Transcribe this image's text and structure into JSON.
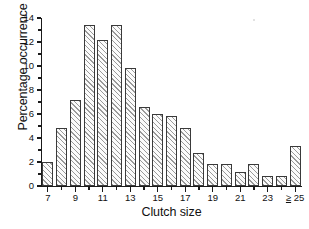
{
  "chart_data": {
    "type": "bar",
    "title": "",
    "subtitle": "",
    "xlabel": "Clutch size",
    "ylabel": "Percentage occurrence",
    "categories": [
      "7",
      "8",
      "9",
      "10",
      "11",
      "12",
      "13",
      "14",
      "15",
      "16",
      "17",
      "18",
      "19",
      "20",
      "21",
      "22",
      "23",
      "24",
      "≥ 25"
    ],
    "values": [
      2.0,
      4.8,
      7.2,
      13.4,
      12.2,
      13.4,
      9.8,
      6.6,
      6.0,
      5.8,
      4.8,
      2.75,
      1.8,
      1.8,
      1.2,
      1.8,
      0.8,
      0.8,
      3.35
    ],
    "ylim": [
      0,
      14
    ],
    "xlim": [
      6.5,
      25.5
    ],
    "y_ticks_major": [
      0,
      2,
      4,
      6,
      8,
      10,
      12,
      14
    ],
    "y_ticks_minor": [
      1,
      3,
      5,
      7,
      9,
      11,
      13
    ],
    "y_tick_labels": [
      "0",
      "2",
      "4",
      "6",
      "8",
      "10",
      "12",
      "14"
    ],
    "x_tick_labels": [
      "7",
      "9",
      "11",
      "13",
      "15",
      "17",
      "19",
      "21",
      "23",
      "≥ 25"
    ],
    "x_tick_label_categories": [
      "7",
      "9",
      "11",
      "13",
      "15",
      "17",
      "19",
      "21",
      "23",
      "≥ 25"
    ],
    "x_ticks_minor_categories": [
      "8",
      "10",
      "12",
      "14",
      "16",
      "18",
      "20",
      "22",
      "24"
    ],
    "grid": false,
    "legend": false,
    "bar_fill": "#fbfbfb",
    "bar_hatch": "diagonal-45",
    "bar_edge_color": "#3a3a3a",
    "axis_color": "#1a1a1a",
    "background": "#ffffff"
  }
}
